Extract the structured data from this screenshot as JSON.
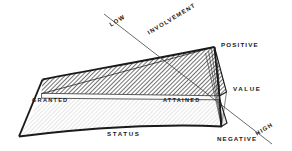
{
  "diagram": {
    "background_color": "#ffffff",
    "stroke_color": "#1a1a1a",
    "hatch_color": "#2b2b2b",
    "lower_fill_color": "#f0f0f0",
    "band_fill_color": "#fbfbfb",
    "axes": {
      "involvement": {
        "name": "INVOLVEMENT",
        "low_label": "LOW",
        "high_label": "HIGH"
      },
      "value": {
        "name": "VALUE",
        "positive_label": "POSITIVE",
        "negative_label": "NEGATIVE"
      },
      "status": {
        "name": "STATUS"
      }
    },
    "regions": {
      "granted": "GRANTED",
      "attained": "ATTAINED"
    }
  }
}
